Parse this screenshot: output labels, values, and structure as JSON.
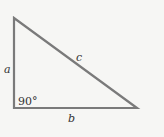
{
  "diagram": {
    "type": "right-triangle",
    "labels": {
      "a": "a",
      "b": "b",
      "c": "c",
      "angle": "90°"
    },
    "stroke_color": "#7a7a7a",
    "background": "#f6f6f4"
  }
}
